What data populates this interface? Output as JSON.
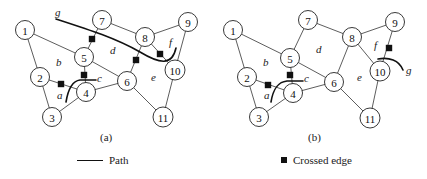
{
  "panels": [
    {
      "id": "a",
      "caption": "(a)",
      "nodes": [
        {
          "id": "1",
          "x": 25,
          "y": 30
        },
        {
          "id": "2",
          "x": 40,
          "y": 77
        },
        {
          "id": "3",
          "x": 52,
          "y": 117
        },
        {
          "id": "4",
          "x": 86,
          "y": 92
        },
        {
          "id": "5",
          "x": 84,
          "y": 57
        },
        {
          "id": "6",
          "x": 127,
          "y": 81
        },
        {
          "id": "7",
          "x": 102,
          "y": 20
        },
        {
          "id": "8",
          "x": 145,
          "y": 37
        },
        {
          "id": "9",
          "x": 188,
          "y": 22
        },
        {
          "id": "10",
          "x": 175,
          "y": 70
        },
        {
          "id": "11",
          "x": 163,
          "y": 117
        }
      ],
      "face_labels": [
        {
          "text": "a",
          "x": 57,
          "y": 99
        },
        {
          "text": "b",
          "x": 56,
          "y": 66
        },
        {
          "text": "c",
          "x": 97,
          "y": 82
        },
        {
          "text": "d",
          "x": 110,
          "y": 54
        },
        {
          "text": "e",
          "x": 151,
          "y": 81
        },
        {
          "text": "f",
          "x": 169,
          "y": 46
        },
        {
          "text": "g",
          "x": 55,
          "y": 16
        }
      ],
      "crossed_edge_marks": [
        {
          "x": 92,
          "y": 39
        },
        {
          "x": 84,
          "y": 75
        },
        {
          "x": 61,
          "y": 84
        },
        {
          "x": 136,
          "y": 60
        },
        {
          "x": 160,
          "y": 54
        }
      ]
    },
    {
      "id": "b",
      "caption": "(b)",
      "nodes": [
        {
          "id": "1",
          "x": 24,
          "y": 30
        },
        {
          "id": "2",
          "x": 38,
          "y": 77
        },
        {
          "id": "3",
          "x": 50,
          "y": 117
        },
        {
          "id": "4",
          "x": 84,
          "y": 93
        },
        {
          "id": "5",
          "x": 81,
          "y": 58
        },
        {
          "id": "6",
          "x": 125,
          "y": 82
        },
        {
          "id": "7",
          "x": 99,
          "y": 20
        },
        {
          "id": "8",
          "x": 143,
          "y": 37
        },
        {
          "id": "9",
          "x": 186,
          "y": 22
        },
        {
          "id": "10",
          "x": 171,
          "y": 71
        },
        {
          "id": "11",
          "x": 161,
          "y": 118
        }
      ],
      "face_labels": [
        {
          "text": "a",
          "x": 55,
          "y": 99
        },
        {
          "text": "b",
          "x": 54,
          "y": 66
        },
        {
          "text": "c",
          "x": 95,
          "y": 82
        },
        {
          "text": "d",
          "x": 107,
          "y": 53
        },
        {
          "text": "e",
          "x": 148,
          "y": 81
        },
        {
          "text": "f",
          "x": 165,
          "y": 49
        },
        {
          "text": "g",
          "x": 197,
          "y": 74
        }
      ],
      "crossed_edge_marks": [
        {
          "x": 81,
          "y": 75
        },
        {
          "x": 59,
          "y": 85
        },
        {
          "x": 180,
          "y": 48
        }
      ]
    }
  ],
  "edges": [
    [
      "1",
      "2"
    ],
    [
      "1",
      "5"
    ],
    [
      "2",
      "3"
    ],
    [
      "2",
      "4"
    ],
    [
      "3",
      "4"
    ],
    [
      "4",
      "5"
    ],
    [
      "4",
      "6"
    ],
    [
      "5",
      "6"
    ],
    [
      "5",
      "7"
    ],
    [
      "6",
      "8"
    ],
    [
      "6",
      "11"
    ],
    [
      "7",
      "8"
    ],
    [
      "8",
      "9"
    ],
    [
      "8",
      "10"
    ],
    [
      "9",
      "10"
    ],
    [
      "10",
      "11"
    ]
  ],
  "legend": {
    "path_label": "Path",
    "crossed_edge_label": "Crossed edge"
  }
}
